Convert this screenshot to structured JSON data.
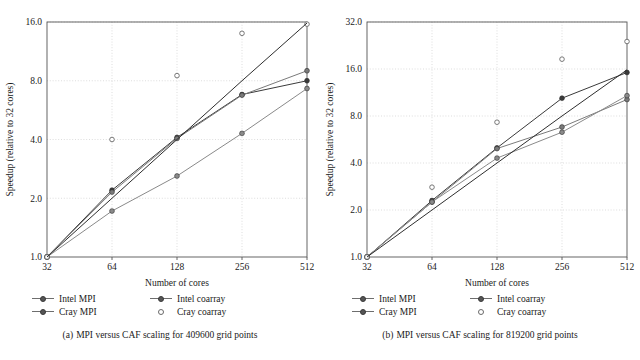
{
  "figure": {
    "background_color": "#ffffff",
    "ink_color": "#1a1a1a",
    "grid_color": "#cfcfcf",
    "frame_color": "#555555"
  },
  "panels": [
    {
      "id": "panel-a",
      "caption_tag": "(a)",
      "caption_text": "MPI versus CAF scaling for 409600 grid points",
      "chart_data": {
        "type": "line",
        "title": "MPI versus CAF scaling for 409600 grid points",
        "xlabel": "Number of cores",
        "ylabel": "Speedup (relative to 32 cores)",
        "xscale": "log2",
        "yscale": "log2",
        "x": [
          32,
          64,
          128,
          256,
          512
        ],
        "xtick_labels": [
          "32",
          "64",
          "128",
          "256",
          "512"
        ],
        "ytick_labels": [
          "1.0",
          "2.0",
          "4.0",
          "8.0",
          "16.0"
        ],
        "yticks": [
          1.0,
          2.0,
          4.0,
          8.0,
          16.0
        ],
        "xlim": [
          32,
          512
        ],
        "ylim": [
          1.0,
          16.0
        ],
        "grid": true,
        "legend_position": "below-plot",
        "series": [
          {
            "name": "Intel MPI",
            "marker": "filled-circle",
            "line": true,
            "color": "#3a3a3a",
            "values": [
              1.0,
              2.2,
              4.1,
              6.8,
              8.0
            ]
          },
          {
            "name": "Cray MPI",
            "marker": "filled-circle",
            "line": true,
            "color": "#7a7a7a",
            "values": [
              1.0,
              2.15,
              4.05,
              6.75,
              9.0
            ]
          },
          {
            "name": "Intel coarray",
            "marker": "filled-circle",
            "line": true,
            "color": "#8a8a8a",
            "values": [
              1.0,
              1.72,
              2.6,
              4.3,
              7.3
            ]
          },
          {
            "name": "Cray coarray",
            "marker": "open-circle",
            "line": false,
            "color": "#6a6a6a",
            "values": [
              1.0,
              4.0,
              8.5,
              14.0,
              15.6
            ]
          },
          {
            "name": "ideal",
            "marker": "none",
            "line": true,
            "color": "#2e2e2e",
            "values": [
              1.0,
              2.0,
              4.0,
              8.0,
              15.8
            ]
          }
        ]
      }
    },
    {
      "id": "panel-b",
      "caption_tag": "(b)",
      "caption_text": "MPI versus CAF scaling for 819200 grid points",
      "chart_data": {
        "type": "line",
        "title": "MPI versus CAF scaling for 819200 grid points",
        "xlabel": "Number of cores",
        "ylabel": "Speedup (relative to 32 cores)",
        "xscale": "log2",
        "yscale": "log2",
        "x": [
          32,
          64,
          128,
          256,
          512
        ],
        "xtick_labels": [
          "32",
          "64",
          "128",
          "256",
          "512"
        ],
        "ytick_labels": [
          "1.0",
          "2.0",
          "4.0",
          "8.0",
          "16.0",
          "32.0"
        ],
        "yticks": [
          1.0,
          2.0,
          4.0,
          8.0,
          16.0,
          32.0
        ],
        "xlim": [
          32,
          512
        ],
        "ylim": [
          1.0,
          32.0
        ],
        "grid": true,
        "legend_position": "below-plot",
        "series": [
          {
            "name": "Intel MPI",
            "marker": "filled-circle",
            "line": true,
            "color": "#3a3a3a",
            "values": [
              1.0,
              2.3,
              5.0,
              10.4,
              15.2
            ]
          },
          {
            "name": "Cray MPI",
            "marker": "filled-circle",
            "line": true,
            "color": "#7a7a7a",
            "values": [
              1.0,
              2.25,
              4.95,
              6.8,
              10.2
            ]
          },
          {
            "name": "Intel coarray",
            "marker": "filled-circle",
            "line": true,
            "color": "#8a8a8a",
            "values": [
              1.0,
              2.25,
              4.3,
              6.3,
              10.8
            ]
          },
          {
            "name": "Cray coarray",
            "marker": "open-circle",
            "line": false,
            "color": "#6a6a6a",
            "values": [
              1.0,
              2.8,
              7.3,
              18.5,
              24.0
            ]
          },
          {
            "name": "ideal",
            "marker": "none",
            "line": true,
            "color": "#2e2e2e",
            "values": [
              1.0,
              2.0,
              4.0,
              8.0,
              15.8
            ]
          }
        ]
      }
    }
  ],
  "legend": {
    "entries": [
      {
        "label": "Intel MPI",
        "marker": "line-filled-circle"
      },
      {
        "label": "Intel coarray",
        "marker": "line-filled-circle"
      },
      {
        "label": "Cray MPI",
        "marker": "line-filled-circle"
      },
      {
        "label": "Cray coarray",
        "marker": "open-circle"
      }
    ]
  }
}
